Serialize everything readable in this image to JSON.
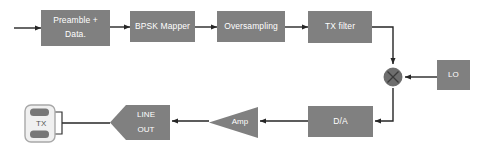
{
  "diagram": {
    "colors": {
      "block_fill": "#808080",
      "block_label": "#ffffff",
      "wire": "#262626",
      "mixer_fill": "#6e6e6e",
      "connector_fill": "#f0f0f0",
      "connector_border": "#a8a8a8",
      "connector_pin": "#777777",
      "background": "#ffffff"
    },
    "blocks": [
      {
        "id": "preamble-data",
        "shape": "rectangle",
        "lines": [
          "Preamble +",
          "Data."
        ],
        "x": 41,
        "y": 10,
        "w": 69,
        "h": 36
      },
      {
        "id": "bpsk-mapper",
        "shape": "rectangle",
        "lines": [
          "BPSK Mapper"
        ],
        "x": 130,
        "y": 11,
        "w": 65,
        "h": 31
      },
      {
        "id": "oversampling",
        "shape": "rectangle",
        "lines": [
          "Oversampling"
        ],
        "x": 217,
        "y": 11,
        "w": 68,
        "h": 31
      },
      {
        "id": "tx-filter",
        "shape": "rectangle",
        "lines": [
          "TX filter"
        ],
        "x": 308,
        "y": 11,
        "w": 64,
        "h": 32
      },
      {
        "id": "local-oscillator",
        "shape": "rectangle",
        "lines": [
          "LO"
        ],
        "x": 437,
        "y": 60,
        "w": 33,
        "h": 30
      },
      {
        "id": "dac",
        "shape": "rectangle",
        "lines": [
          "D/A"
        ],
        "x": 308,
        "y": 106,
        "w": 65,
        "h": 31
      },
      {
        "id": "amplifier",
        "shape": "triangle-left",
        "lines": [
          "Amp"
        ],
        "x": 209,
        "y": 107,
        "w": 49,
        "h": 31
      },
      {
        "id": "line-out",
        "shape": "hexagon-left-point",
        "lines": [
          "LINE",
          "OUT"
        ],
        "x": 110,
        "y": 105,
        "w": 60,
        "h": 35
      },
      {
        "id": "tx-connector",
        "shape": "rounded-connector",
        "lines": [
          "TX"
        ],
        "x": 25,
        "y": 105,
        "w": 30,
        "h": 37
      }
    ],
    "mixer": {
      "id": "mixer",
      "label": "multiplier",
      "cx": 393,
      "cy": 77,
      "r": 9
    },
    "signal_flow": [
      "input → Preamble + Data.",
      "Preamble + Data. → BPSK Mapper",
      "BPSK Mapper → Oversampling",
      "Oversampling → TX filter",
      "TX filter → mixer",
      "LO → mixer",
      "mixer → D/A",
      "D/A → Amp",
      "Amp → LINE OUT",
      "LINE OUT → TX"
    ]
  }
}
